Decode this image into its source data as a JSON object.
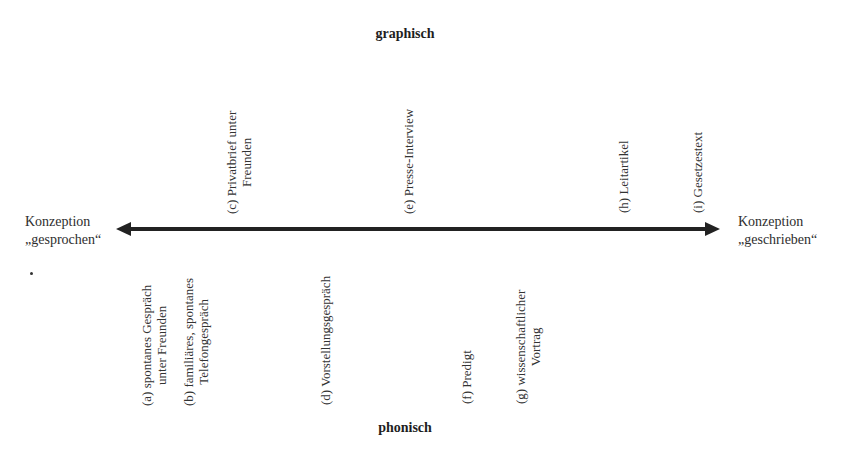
{
  "diagram": {
    "type": "continuum",
    "top_label": "graphisch",
    "bottom_label": "phonisch",
    "left_pole": {
      "line1": "Konzeption",
      "line2": "„gesprochen“"
    },
    "right_pole": {
      "line1": "Konzeption",
      "line2": "„geschrieben“"
    },
    "axis": {
      "direction": "bidirectional",
      "color": "#222222"
    },
    "top_items": [
      {
        "id": "c",
        "line1": "(c) Privatbrief unter",
        "line2": "Freunden"
      },
      {
        "id": "e",
        "line1": "(e) Presse-Interview",
        "line2": ""
      },
      {
        "id": "h",
        "line1": "(h) Leitartikel",
        "line2": ""
      },
      {
        "id": "i",
        "line1": "(i) Gesetzestext",
        "line2": ""
      }
    ],
    "bottom_items": [
      {
        "id": "a",
        "line1": "(a) spontanes Gespräch",
        "line2": "unter Freunden"
      },
      {
        "id": "b",
        "line1": "(b) familiäres, spontanes",
        "line2": "Telefongespräch"
      },
      {
        "id": "d",
        "line1": "(d) Vorstellungsgespräch",
        "line2": ""
      },
      {
        "id": "f",
        "line1": "(f) Predigt",
        "line2": ""
      },
      {
        "id": "g",
        "line1": "(g) wissenschaftlicher",
        "line2": "Vortrag"
      }
    ]
  }
}
